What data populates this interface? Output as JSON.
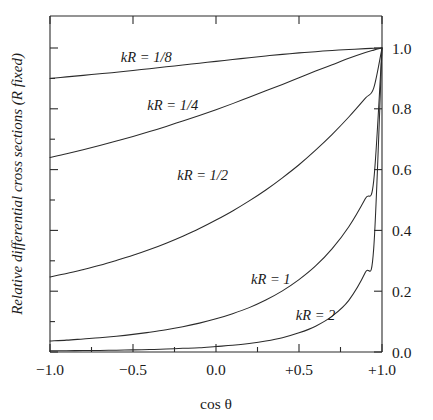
{
  "figure": {
    "y_axis_title": "Relative differential cross sections  (R fixed)",
    "x_axis_title": "cos θ",
    "x_tick_labels": [
      "−1.0",
      "−0.5",
      "0.0",
      "+0.5",
      "+1.0"
    ],
    "y_tick_labels": [
      "0.0",
      "0.2",
      "0.4",
      "0.6",
      "0.8",
      "1.0"
    ],
    "curve_labels": {
      "c1": "kR = 1/8",
      "c2": "kR = 1/4",
      "c3": "kR = 1/2",
      "c4": "kR = 1",
      "c5": "kR = 2"
    },
    "colors": {
      "ink": "#2b2b2b",
      "background": "#ffffff"
    }
  },
  "chart_data": {
    "type": "line",
    "title": "",
    "subtitle": "",
    "xlabel": "cos θ",
    "ylabel": "Relative differential cross sections  (R fixed)",
    "xlim": [
      -1.0,
      1.0
    ],
    "ylim": [
      0.0,
      1.0
    ],
    "xticks": [
      -1.0,
      -0.5,
      0.0,
      0.5,
      1.0
    ],
    "xticklabels": [
      "−1.0",
      "−0.5",
      "0.0",
      "+0.5",
      "+1.0"
    ],
    "xminorticks": [
      -0.75,
      -0.25,
      0.25,
      0.75
    ],
    "yticks": [
      0.0,
      0.2,
      0.4,
      0.6,
      0.8,
      1.0
    ],
    "yticklabels": [
      "0.0",
      "0.2",
      "0.4",
      "0.6",
      "0.8",
      "1.0"
    ],
    "yminorticks": [
      0.1,
      0.3,
      0.5,
      0.7,
      0.9
    ],
    "grid": false,
    "legend": "inline-curve-labels",
    "y_axis_labels_side": "right",
    "tick_direction": "in",
    "x": [
      -1.0,
      -0.9,
      -0.8,
      -0.7,
      -0.6,
      -0.5,
      -0.4,
      -0.3,
      -0.2,
      -0.1,
      0.0,
      0.1,
      0.2,
      0.3,
      0.4,
      0.5,
      0.6,
      0.7,
      0.8,
      0.9,
      0.95,
      1.0
    ],
    "series": [
      {
        "name": "kR = 1/8",
        "label": "kR = 1/8",
        "label_x": -0.42,
        "label_y": 0.955,
        "values": [
          0.9,
          0.905,
          0.91,
          0.915,
          0.92,
          0.926,
          0.932,
          0.938,
          0.944,
          0.95,
          0.956,
          0.962,
          0.968,
          0.974,
          0.979,
          0.984,
          0.988,
          0.992,
          0.995,
          0.998,
          0.999,
          1.0
        ]
      },
      {
        "name": "kR = 1/4",
        "label": "kR = 1/4",
        "label_x": -0.26,
        "label_y": 0.795,
        "values": [
          0.64,
          0.652,
          0.665,
          0.679,
          0.694,
          0.709,
          0.725,
          0.742,
          0.76,
          0.778,
          0.797,
          0.817,
          0.838,
          0.859,
          0.88,
          0.902,
          0.924,
          0.945,
          0.966,
          0.985,
          0.993,
          1.0
        ]
      },
      {
        "name": "kR = 1/2",
        "label": "kR = 1/2",
        "label_x": -0.08,
        "label_y": 0.565,
        "values": [
          0.247,
          0.258,
          0.271,
          0.285,
          0.301,
          0.318,
          0.337,
          0.358,
          0.381,
          0.406,
          0.434,
          0.464,
          0.497,
          0.533,
          0.573,
          0.616,
          0.664,
          0.716,
          0.773,
          0.835,
          0.868,
          1.0
        ]
      },
      {
        "name": "kR = 1",
        "label": "kR = 1",
        "label_x": 0.33,
        "label_y": 0.225,
        "values": [
          0.036,
          0.039,
          0.043,
          0.047,
          0.052,
          0.058,
          0.065,
          0.073,
          0.083,
          0.095,
          0.109,
          0.126,
          0.146,
          0.171,
          0.201,
          0.238,
          0.283,
          0.34,
          0.412,
          0.505,
          0.563,
          1.0
        ]
      },
      {
        "name": "kR = 2",
        "label": "kR = 2",
        "label_x": 0.6,
        "label_y": 0.105,
        "values": [
          0.004,
          0.004,
          0.005,
          0.005,
          0.006,
          0.007,
          0.008,
          0.01,
          0.012,
          0.014,
          0.018,
          0.022,
          0.028,
          0.036,
          0.047,
          0.063,
          0.085,
          0.118,
          0.17,
          0.262,
          0.34,
          1.0
        ]
      }
    ]
  }
}
